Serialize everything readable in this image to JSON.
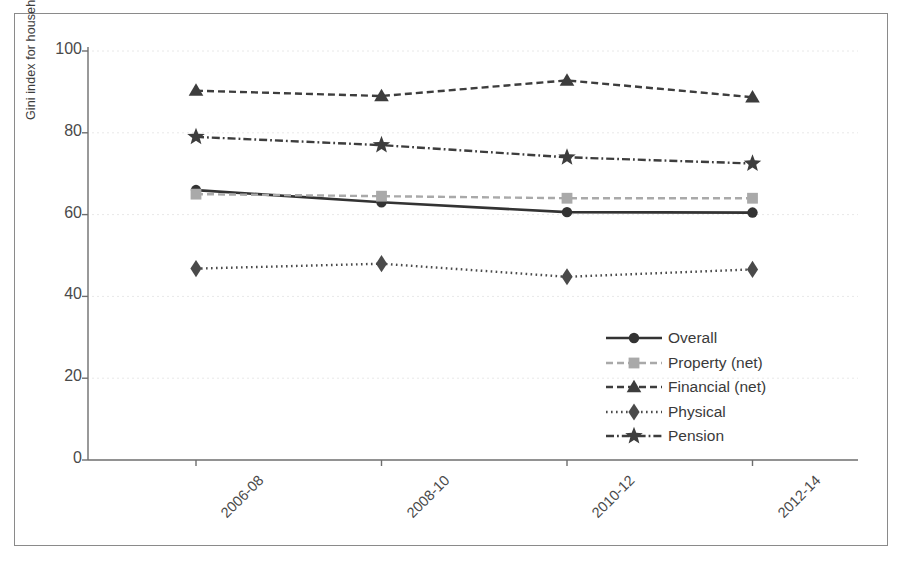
{
  "chart_data": {
    "type": "line",
    "title": "",
    "xlabel": "",
    "ylabel": "Gini index for household wealth",
    "categories": [
      "2006-08",
      "2008-10",
      "2010-12",
      "2012-14"
    ],
    "ylim": [
      0,
      100
    ],
    "yticks": [
      0,
      20,
      40,
      60,
      80,
      100
    ],
    "grid": true,
    "legend_position": "inside-lower-right",
    "series": [
      {
        "name": "Overall",
        "values": [
          66.0,
          63.0,
          60.6,
          60.5
        ],
        "color": "#333333",
        "marker": "circle",
        "linestyle": "solid"
      },
      {
        "name": "Property (net)",
        "values": [
          65.0,
          64.5,
          64.0,
          64.0
        ],
        "color": "#a9a9a9",
        "marker": "square",
        "linestyle": "dashed"
      },
      {
        "name": "Financial (net)",
        "values": [
          90.3,
          89.0,
          92.8,
          88.7
        ],
        "color": "#3d3d3d",
        "marker": "triangle",
        "linestyle": "dashed"
      },
      {
        "name": "Physical",
        "values": [
          46.8,
          48.0,
          44.8,
          46.6
        ],
        "color": "#4a4a4a",
        "marker": "diamond",
        "linestyle": "dotted"
      },
      {
        "name": "Pension",
        "values": [
          79.0,
          77.0,
          74.0,
          72.5
        ],
        "color": "#3d3d3d",
        "marker": "star",
        "linestyle": "dashdot"
      }
    ]
  },
  "axis": {
    "ytick_labels": [
      "100",
      "80",
      "60",
      "40",
      "20",
      "0"
    ],
    "xtick_labels": [
      "2006-08",
      "2008-10",
      "2010-12",
      "2012-14"
    ]
  },
  "legend": {
    "items": [
      {
        "label": "Overall"
      },
      {
        "label": "Property (net)"
      },
      {
        "label": "Financial (net)"
      },
      {
        "label": "Physical"
      },
      {
        "label": "Pension"
      }
    ]
  },
  "colors": {
    "frame": "#8a8a8a",
    "axis": "#6e6e6e",
    "grid": "#e8e8e8",
    "dark": "#3d3d3d",
    "light_gray": "#a9a9a9"
  }
}
